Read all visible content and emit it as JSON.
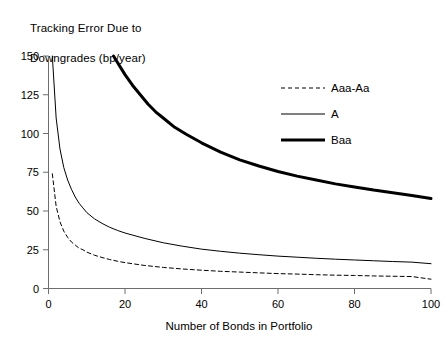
{
  "chart_data": {
    "type": "line",
    "title": "Tracking Error Due to\nDowngrades (bp/year)",
    "title_line1": "Tracking Error Due to",
    "title_line2": "Downgrades (bp/year)",
    "xlabel": "Number of Bonds in Portfolio",
    "ylabel": "",
    "xlim": [
      0,
      100
    ],
    "ylim": [
      0,
      150
    ],
    "xticks": [
      0,
      20,
      40,
      60,
      80,
      100
    ],
    "yticks": [
      0,
      25,
      50,
      75,
      100,
      125,
      150
    ],
    "xtick_labels": [
      "0",
      "20",
      "40",
      "60",
      "80",
      "100"
    ],
    "ytick_labels": [
      "0",
      "25",
      "50",
      "75",
      "100",
      "125",
      "150"
    ],
    "grid": false,
    "legend_position": "upper-right-inside",
    "series": [
      {
        "name": "Aaa-Aa",
        "style": "dashed",
        "width": 1,
        "color": "#000000",
        "x": [
          1,
          2,
          3,
          4,
          5,
          6,
          7,
          8,
          9,
          10,
          12,
          14,
          16,
          18,
          20,
          25,
          30,
          35,
          40,
          45,
          50,
          55,
          60,
          65,
          70,
          75,
          80,
          85,
          90,
          95,
          100
        ],
        "values": [
          74,
          53,
          43,
          37,
          33,
          30,
          28,
          26,
          25,
          23.5,
          21.5,
          20,
          18.7,
          17.6,
          16.7,
          14.9,
          13.6,
          12.6,
          11.8,
          11.1,
          10.6,
          10.1,
          9.6,
          9.3,
          8.9,
          8.6,
          8.4,
          8.1,
          7.9,
          7.7,
          6.0
        ]
      },
      {
        "name": "A",
        "style": "solid",
        "width": 1,
        "color": "#000000",
        "x": [
          1,
          2,
          3,
          4,
          5,
          6,
          7,
          8,
          9,
          10,
          12,
          14,
          16,
          18,
          20,
          25,
          30,
          35,
          40,
          45,
          50,
          55,
          60,
          65,
          70,
          75,
          80,
          85,
          90,
          95,
          100
        ],
        "values": [
          150,
          110,
          90,
          78,
          70,
          64,
          59,
          55,
          52,
          49,
          45,
          42,
          39.5,
          37.5,
          35.8,
          32.4,
          29.5,
          27.3,
          25.4,
          24.0,
          22.8,
          21.8,
          20.9,
          20.2,
          19.5,
          18.9,
          18.4,
          17.9,
          17.4,
          17.0,
          16.0
        ]
      },
      {
        "name": "Baa",
        "style": "solid",
        "width": 3,
        "color": "#000000",
        "x": [
          17,
          18,
          20,
          22,
          24,
          26,
          28,
          30,
          33,
          36,
          40,
          45,
          50,
          55,
          60,
          65,
          70,
          75,
          80,
          85,
          90,
          95,
          100
        ],
        "values": [
          150,
          146,
          138,
          131,
          125,
          119,
          114,
          110,
          104,
          99.5,
          94,
          88,
          83,
          79,
          75.5,
          72.5,
          70,
          67.5,
          65.5,
          63.5,
          61.8,
          60.0,
          58.0
        ]
      }
    ]
  },
  "legend": {
    "items": [
      {
        "label": "Aaa-Aa",
        "style": "dashed",
        "width": 1
      },
      {
        "label": "A",
        "style": "solid",
        "width": 1
      },
      {
        "label": "Baa",
        "style": "solid",
        "width": 3
      }
    ]
  },
  "axes": {
    "x_title": "Number of Bonds in Portfolio"
  }
}
